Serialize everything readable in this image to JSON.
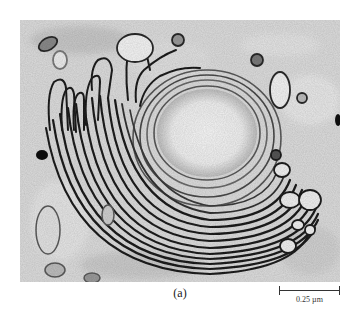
{
  "figure": {
    "panel_label": "(a)",
    "scale_bar": {
      "label": "0.25 µm"
    },
    "image_subject": "electron-micrograph-golgi-stacks"
  },
  "colors": {
    "background": "#ffffff",
    "cytoplasm": "#d9d9d9",
    "membrane": "#1e1e1e",
    "lumen": "#f2f2f2"
  }
}
